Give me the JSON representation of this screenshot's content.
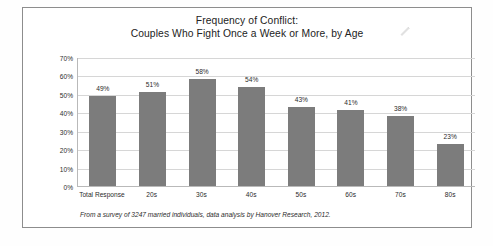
{
  "chart_data": {
    "type": "bar",
    "title": "Frequency of Conflict: Couples Who Fight Once a Week or More, by Age",
    "title_lines": [
      "Frequency of Conflict:",
      "Couples Who Fight Once a Week or More, by Age"
    ],
    "categories": [
      "Total Response",
      "20s",
      "30s",
      "40s",
      "50s",
      "60s",
      "70s",
      "80s"
    ],
    "values": [
      49,
      51,
      58,
      54,
      43,
      41,
      38,
      23
    ],
    "value_labels": [
      "49%",
      "51%",
      "58%",
      "54%",
      "43%",
      "41%",
      "38%",
      "23%"
    ],
    "xlabel": "",
    "ylabel": "",
    "ylim": [
      0,
      70
    ],
    "ytick_step": 10,
    "ytick_labels": [
      "70%",
      "60%",
      "50%",
      "40%",
      "30%",
      "20%",
      "10%",
      "0%"
    ],
    "ytick_values": [
      70,
      60,
      50,
      40,
      30,
      20,
      10,
      0
    ],
    "grid": true,
    "legend": false,
    "bar_color": "#7c7c7c",
    "gridline_color": "#d6d6d6",
    "axis_color": "#b9b9b9"
  },
  "footnote": {
    "text": "From a survey of 3247 married individuals, data analysis by Hanover Research, 2012."
  },
  "artifact": {
    "name": "pen-mark"
  }
}
